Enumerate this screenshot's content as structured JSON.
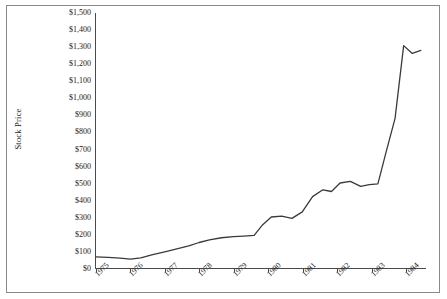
{
  "chart_data": {
    "type": "line",
    "title": "",
    "xlabel": "",
    "ylabel": "Stock Price",
    "categories": [
      "1975",
      "1976",
      "1977",
      "1978",
      "1979",
      "1980",
      "1981",
      "1982",
      "1983",
      "1984"
    ],
    "x_tick_labels": [
      "1975",
      "1976",
      "1977",
      "1978",
      "1979",
      "1980",
      "1981",
      "1982",
      "1983",
      "1984"
    ],
    "y_tick_labels": [
      "$1,500",
      "$1,400",
      "$1,300",
      "$1,200",
      "$1,100",
      "$1,000",
      "$900",
      "$800",
      "$700",
      "$600",
      "$500",
      "$400",
      "$300",
      "$200",
      "$100",
      "$0"
    ],
    "y_tick_values": [
      1500,
      1400,
      1300,
      1200,
      1100,
      1000,
      900,
      800,
      700,
      600,
      500,
      400,
      300,
      200,
      100,
      0
    ],
    "ylim": [
      0,
      1500
    ],
    "xlim": [
      1975,
      1984.6
    ],
    "grid": false,
    "legend": "none",
    "line_color": "#3a3a3a",
    "series": [
      {
        "name": "Stock Price",
        "x": [
          1975.0,
          1975.35,
          1975.7,
          1976.0,
          1976.3,
          1976.65,
          1977.0,
          1977.35,
          1977.7,
          1978.0,
          1978.3,
          1978.65,
          1979.0,
          1979.3,
          1979.6,
          1979.85,
          1980.1,
          1980.4,
          1980.7,
          1981.0,
          1981.3,
          1981.6,
          1981.85,
          1982.1,
          1982.4,
          1982.7,
          1982.95,
          1983.2,
          1983.45,
          1983.7,
          1983.95,
          1984.2,
          1984.45
        ],
        "values": [
          65,
          62,
          58,
          52,
          60,
          78,
          95,
          112,
          130,
          150,
          165,
          178,
          185,
          188,
          192,
          255,
          300,
          305,
          292,
          330,
          420,
          460,
          450,
          500,
          510,
          480,
          490,
          495,
          690,
          880,
          1308,
          1262,
          1280
        ]
      }
    ]
  }
}
